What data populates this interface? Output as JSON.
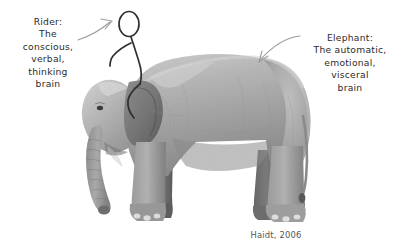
{
  "figure": {
    "background_color": "#ffffff"
  },
  "rider_annotation": {
    "name": "rider-label",
    "lines": [
      "Rider:",
      "The",
      "conscious,",
      "verbal,",
      "thinking",
      "brain"
    ],
    "color": "#2b2b2b"
  },
  "elephant_annotation": {
    "name": "elephant-label",
    "lines": [
      "Elephant:",
      "The automatic,",
      "emotional,",
      "visceral",
      "brain"
    ],
    "color": "#2b2b2b"
  },
  "citation": {
    "text": "Haidt, 2006",
    "color": "#555555"
  },
  "arrows": {
    "rider_arrow": {
      "label": "curved arrow pointing to the stick figure rider",
      "direction": "right",
      "color": "#9b9b9b"
    },
    "elephant_arrow": {
      "label": "curved arrow pointing to the elephant's back",
      "direction": "down-left",
      "color": "#9b9b9b"
    }
  },
  "artwork": {
    "elephant": {
      "label": "grayscale photographic elephant facing left",
      "body_color": "#a8a8a8",
      "shadow_color": "#6d6d6d",
      "highlight_color": "#cfcfcf"
    },
    "rider": {
      "label": "hand-drawn stick figure seated on the elephant's back",
      "stroke_color": "#2f2f2f"
    }
  }
}
